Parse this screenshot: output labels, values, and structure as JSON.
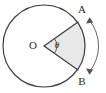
{
  "figure": {
    "kind": "circle-sector-arc-diagram",
    "background_color": "#ffffff",
    "stroke_color": "#3a3a3a",
    "arrow_color": "#555555",
    "sector_fill_color": "#e8e8e8",
    "label_color": "#2b2b2b"
  },
  "circle": {
    "center_label": "O",
    "center_x": 44,
    "center_y": 46,
    "radius": 41
  },
  "points": [
    {
      "label": "A",
      "x": 78,
      "y": 22,
      "label_x": 82,
      "label_y": 10
    },
    {
      "label": "B",
      "x": 78,
      "y": 70,
      "label_x": 82,
      "label_y": 82
    }
  ],
  "angle": {
    "symbol": "θ",
    "vertex_label": "O",
    "label_x": 57,
    "label_y": 46,
    "arc_radius": 13
  },
  "arc_arrow": {
    "double_headed": true,
    "start_x": 89,
    "start_y": 18,
    "end_x": 89,
    "end_y": 74,
    "radius": 40,
    "label": ""
  },
  "labels": {
    "center": "O",
    "point_a": "A",
    "point_b": "B",
    "angle": "θ"
  }
}
